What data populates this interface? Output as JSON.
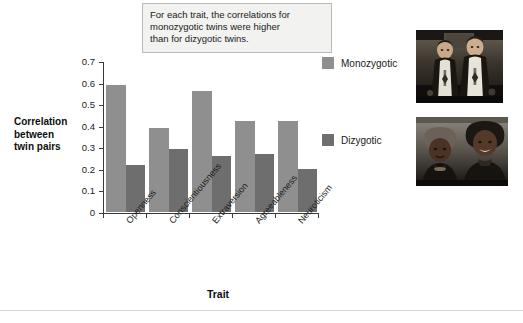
{
  "annotation": {
    "lines": [
      "For each trait, the correlations for",
      "monozygotic twins were higher",
      "than for dizygotic twins."
    ]
  },
  "axis_title_y": {
    "lines": [
      "Correlation",
      "between",
      "twin pairs"
    ]
  },
  "legend": {
    "items": [
      {
        "label": "Monozygotic",
        "color": "#8f8f8f"
      },
      {
        "label": "Dizygotic",
        "color": "#6e6e6e"
      }
    ]
  },
  "photos": [
    {
      "caption": "white-male-twins-photo"
    },
    {
      "caption": "black-female-twins-photo"
    }
  ],
  "chart_data": {
    "type": "bar",
    "title": "",
    "xlabel": "Trait",
    "ylabel": "Correlation between twin pairs",
    "categories": [
      "Openness",
      "Conscientiousness",
      "Extraversion",
      "Agreeableness",
      "Neuroticism"
    ],
    "series": [
      {
        "name": "Monozygotic",
        "color": "#8f8f8f",
        "values": [
          0.59,
          0.39,
          0.56,
          0.42,
          0.42
        ]
      },
      {
        "name": "Dizygotic",
        "color": "#6e6e6e",
        "values": [
          0.22,
          0.29,
          0.26,
          0.27,
          0.2
        ]
      }
    ],
    "ylim": [
      0,
      0.7
    ],
    "yticks": [
      0,
      0.1,
      0.2,
      0.3,
      0.4,
      0.5,
      0.6,
      0.7
    ],
    "ytick_labels": [
      "0",
      "0.1",
      "0.2",
      "0.3",
      "0.4",
      "0.5",
      "0.6",
      "0.7"
    ],
    "grid": false,
    "legend_position": "right"
  }
}
